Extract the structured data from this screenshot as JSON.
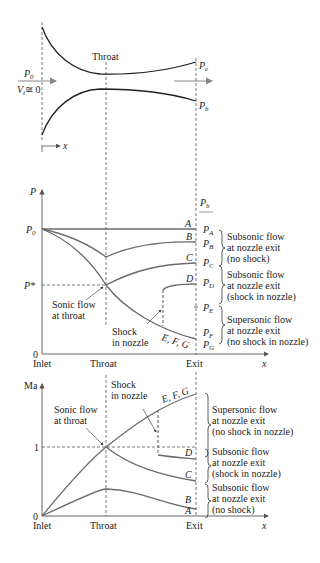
{
  "nozzle": {
    "throat_label": "Throat",
    "inlet_pressure": "P",
    "inlet_pressure_sub": "0",
    "inlet_velocity": "V",
    "inlet_velocity_sub": "i",
    "inlet_velocity_eq": "≅ 0",
    "exit_pressure": "P",
    "exit_pressure_sub": "e",
    "back_pressure": "P",
    "back_pressure_sub": "b",
    "x_axis": "x"
  },
  "pressure_chart": {
    "y_label": "P",
    "back_pressure_label": "P",
    "back_pressure_sub": "b",
    "p0_label": "P",
    "p0_sub": "0",
    "pstar_label": "P*",
    "zero_label": "0",
    "x_ticks": [
      "Inlet",
      "Throat",
      "Exit"
    ],
    "x_label": "x",
    "curve_labels": [
      "A",
      "B",
      "C",
      "D",
      "E, F, G"
    ],
    "exit_pressures": [
      "A",
      "B",
      "C",
      "D",
      "E",
      "F",
      "G"
    ],
    "sonic_note": [
      "Sonic flow",
      "at throat"
    ],
    "shock_note": [
      "Shock",
      "in nozzle"
    ],
    "regimes": [
      [
        "Subsonic flow",
        "at nozzle exit",
        "(no shock)"
      ],
      [
        "Subsonic flow",
        "at nozzle exit",
        "(shock in nozzle)"
      ],
      [
        "Supersonic flow",
        "at nozzle exit",
        "(no shock in nozzle)"
      ]
    ]
  },
  "mach_chart": {
    "y_label": "Ma",
    "one_label": "1",
    "zero_label": "0",
    "x_ticks": [
      "Inlet",
      "Throat",
      "Exit"
    ],
    "x_label": "x",
    "curve_labels": [
      "A",
      "B",
      "C",
      "D",
      "E, F, G"
    ],
    "sonic_note": [
      "Sonic flow",
      "at throat"
    ],
    "shock_note": [
      "Shock",
      "in nozzle"
    ],
    "regimes": [
      [
        "Supersonic flow",
        "at nozzle exit",
        "(no shock in nozzle)"
      ],
      [
        "Subsonic flow",
        "at nozzle exit",
        "(shock in nozzle)"
      ],
      [
        "Subsonic flow",
        "at nozzle exit",
        "(no shock)"
      ]
    ]
  },
  "colors": {
    "line": "#222222",
    "axis": "#555555",
    "curve": "#6b6b6b",
    "arrow": "#888888"
  }
}
